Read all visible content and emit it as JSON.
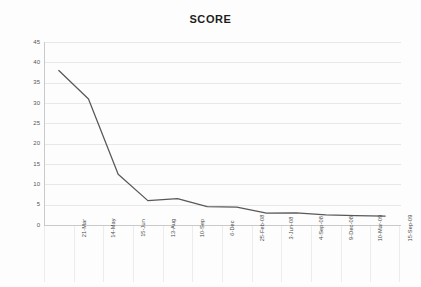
{
  "chart_data": {
    "type": "line",
    "title": "SCORE",
    "xlabel": "",
    "ylabel": "",
    "ylim": [
      0,
      45
    ],
    "yticks": [
      0,
      5,
      10,
      15,
      20,
      25,
      30,
      35,
      40,
      45
    ],
    "grid": true,
    "legend": "none",
    "line_color": "#585858",
    "grid_color": "#e8e8e8",
    "axis_color": "#c9c9c9",
    "categories": [
      "21-Mar",
      "14-May",
      "15-Jun",
      "13-Aug",
      "10-Sep",
      "6-Dec",
      "25-Feb-08",
      "3-Jun-08",
      "4-Sep-08",
      "9-Dec-08",
      "10-Mar-09",
      "15-Sep-09"
    ],
    "series": [
      {
        "name": "SCORE",
        "values": [
          38,
          31,
          12.5,
          6,
          6.5,
          4.5,
          4.4,
          2.9,
          3,
          2.5,
          2.3,
          2.2
        ]
      }
    ]
  }
}
